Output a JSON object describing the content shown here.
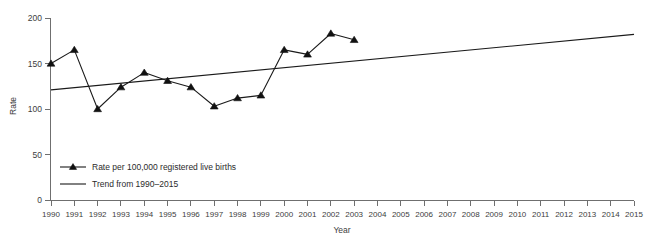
{
  "chart_data": {
    "type": "line",
    "title": "",
    "xlabel": "Year",
    "ylabel": "Rate",
    "xlim": [
      1990,
      2015
    ],
    "ylim": [
      0,
      200
    ],
    "grid": false,
    "legend_position": "inside-bottom-left",
    "y_ticks": [
      0,
      50,
      100,
      150,
      200
    ],
    "x_ticks": [
      1990,
      1991,
      1992,
      1993,
      1994,
      1995,
      1996,
      1997,
      1998,
      1999,
      2000,
      2001,
      2002,
      2003,
      2004,
      2005,
      2006,
      2007,
      2008,
      2009,
      2010,
      2011,
      2012,
      2013,
      2014,
      2015
    ],
    "series": [
      {
        "name": "Rate per 100,000 registered live births",
        "marker": "triangle",
        "x": [
          1990,
          1991,
          1992,
          1993,
          1994,
          1995,
          1996,
          1997,
          1998,
          1999,
          2000,
          2001,
          2002,
          2003
        ],
        "values": [
          150,
          165,
          100,
          124,
          140,
          131,
          124,
          103,
          112,
          115,
          165,
          160,
          183,
          176
        ]
      },
      {
        "name": "Trend from 1990–2015",
        "marker": "none",
        "x": [
          1990,
          2015
        ],
        "values": [
          121,
          182
        ]
      }
    ],
    "legend": [
      "Rate per 100,000 registered live births",
      "Trend from 1990–2015"
    ]
  },
  "axes": {
    "y_label": "Rate",
    "x_label": "Year",
    "y_tick_labels": [
      "0",
      "50",
      "100",
      "150",
      "200"
    ],
    "x_tick_labels": [
      "1990",
      "1991",
      "1992",
      "1993",
      "1994",
      "1995",
      "1996",
      "1997",
      "1998",
      "1999",
      "2000",
      "2001",
      "2002",
      "2003",
      "2004",
      "2005",
      "2006",
      "2007",
      "2008",
      "2009",
      "2010",
      "2011",
      "2012",
      "2013",
      "2014",
      "2015"
    ]
  },
  "legend": {
    "items": [
      {
        "label": "Rate per 100,000 registered live births",
        "style": "line-with-triangle-marker"
      },
      {
        "label": "Trend from 1990–2015",
        "style": "plain-line"
      }
    ]
  },
  "colors": {
    "series": "#1a1a1a",
    "axis": "#6f6f6f",
    "text": "#3d3d3d",
    "background": "#ffffff"
  }
}
